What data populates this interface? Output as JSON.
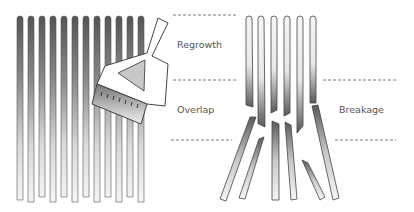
{
  "diagram": {
    "labels": {
      "regrowth": "Regrowth",
      "overlap": "Overlap",
      "breakage": "Breakage"
    },
    "colors": {
      "strand_dark": "#555555",
      "strand_light": "#f2f2f2",
      "outline": "#444444",
      "dash": "#555555",
      "text": "#555555",
      "brush_fill": "#ffffff",
      "brush_triangle": "#c8c8c8"
    },
    "left_panel": {
      "description": "Healthy hair strands with tint brush applying colour",
      "strand_count": 12
    },
    "right_panel": {
      "description": "Broken hair strands at the overlap zone",
      "strand_count": 6
    }
  }
}
